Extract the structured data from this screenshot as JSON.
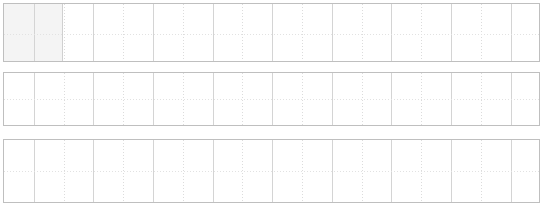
{
  "document": {
    "title": "Blank Grid Worksheet",
    "background_color": "#ffffff",
    "width": 555,
    "height": 211
  },
  "style": {
    "panel_border_color": "#bfbfbf",
    "gridline_solid_color": "#d4d4d4",
    "gridline_dotted_color": "#dcdcdc",
    "midline_color": "#e2e2e2",
    "selected_cell_fill": "#f4f4f4",
    "selected_cell_border": "#d0d0d0"
  },
  "grid": {
    "column_count": 18,
    "column_width": 29.8,
    "line_pattern": [
      "solid",
      "dotted"
    ],
    "vertical_positions": [
      29.8,
      59.6,
      89.4,
      119.2,
      149.0,
      178.8,
      208.6,
      238.4,
      268.2,
      298.0,
      327.8,
      357.6,
      387.4,
      417.2,
      447.0,
      476.8,
      506.6
    ],
    "horizontal_midline": true
  },
  "panels": [
    {
      "id": "panel-top",
      "label": "Panel 1",
      "top": 3,
      "height": 59,
      "midline_ratio": 0.52,
      "has_selection": true
    },
    {
      "id": "panel-middle",
      "label": "Panel 2",
      "top": 72,
      "height": 54,
      "midline_ratio": 0.5,
      "has_selection": false
    },
    {
      "id": "panel-bottom",
      "label": "Panel 3",
      "top": 139,
      "height": 64,
      "midline_ratio": 0.5,
      "has_selection": false
    }
  ],
  "selection": {
    "label": "Selected cell",
    "left": 0,
    "width": 58,
    "fill": "#f4f4f4"
  }
}
